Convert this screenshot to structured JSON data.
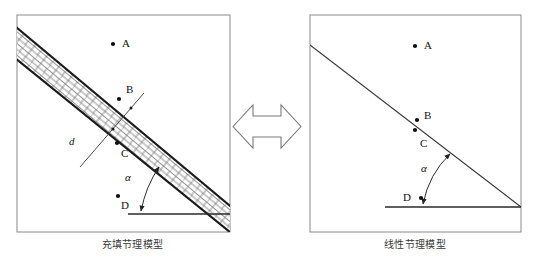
{
  "figure": {
    "width": 534,
    "height": 263,
    "background": "#ffffff",
    "stroke_color": "#1a1a1a",
    "frame_color": "#8a8a8a",
    "brick_fill": "#ffffff",
    "brick_line": "#555555"
  },
  "panels": [
    {
      "id": "left",
      "caption": "充填节理模型",
      "frame": {
        "x": 17,
        "y": 15,
        "w": 213,
        "h": 217
      },
      "joint_type": "filled-band",
      "band": {
        "top_line": {
          "x1": 17,
          "y1": 28,
          "x2": 230,
          "y2": 206
        },
        "bottom_line": {
          "x1": 17,
          "y1": 60,
          "x2": 230,
          "y2": 232
        },
        "hatch": "brick"
      },
      "baseline": {
        "x1": 128,
        "y1": 214,
        "x2": 230,
        "y2": 214
      },
      "points": [
        {
          "label": "A",
          "dot_x": 113,
          "dot_y": 44,
          "label_x": 122,
          "label_y": 40
        },
        {
          "label": "B",
          "dot_x": 119,
          "dot_y": 99,
          "label_x": 126,
          "label_y": 85
        },
        {
          "label": "C",
          "dot_x": 117,
          "dot_y": 143,
          "label_x": 121,
          "label_y": 150
        },
        {
          "label": "D",
          "dot_x": 118,
          "dot_y": 196,
          "label_x": 121,
          "label_y": 203
        }
      ],
      "annotations": [
        {
          "name": "d",
          "text": "d",
          "x": 71,
          "y": 142,
          "italic": true
        },
        {
          "name": "alpha",
          "text": "α",
          "x": 127,
          "y": 176,
          "italic": true
        }
      ],
      "normal_line": {
        "x1": 81,
        "y1": 166,
        "x2": 143,
        "y2": 94
      },
      "angle_arc": {
        "cx": 141,
        "cy": 214,
        "start_x": 141,
        "start_y": 214,
        "end_x": 160,
        "end_y": 166
      }
    },
    {
      "id": "right",
      "caption": "线性节理模型",
      "frame": {
        "x": 310,
        "y": 15,
        "w": 211,
        "h": 217
      },
      "joint_type": "linear",
      "joint_line": {
        "x1": 310,
        "y1": 45,
        "x2": 521,
        "y2": 207
      },
      "baseline": {
        "x1": 385,
        "y1": 207,
        "x2": 521,
        "y2": 207
      },
      "points": [
        {
          "label": "A",
          "dot_x": 415,
          "dot_y": 46,
          "label_x": 424,
          "label_y": 42
        },
        {
          "label": "B",
          "dot_x": 417,
          "dot_y": 120,
          "label_x": 424,
          "label_y": 113
        },
        {
          "label": "C",
          "dot_x": 415,
          "dot_y": 128,
          "label_x": 420,
          "label_y": 140
        },
        {
          "label": "D",
          "dot_x": 421,
          "dot_y": 198,
          "label_x": 404,
          "label_y": 196
        }
      ],
      "annotations": [
        {
          "name": "alpha",
          "text": "α",
          "x": 423,
          "y": 167,
          "italic": true
        }
      ],
      "angle_arc": {
        "cx": 423,
        "cy": 207,
        "start_x": 423,
        "start_y": 207,
        "end_x": 452,
        "end_y": 153
      }
    }
  ],
  "connector": {
    "name": "double-headed-arrow",
    "direction": "bidirectional",
    "x": 233,
    "y": 100,
    "w": 68,
    "h": 53,
    "stroke": "#7a7a7a"
  }
}
